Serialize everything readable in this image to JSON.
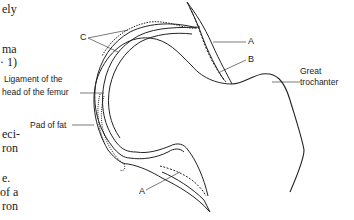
{
  "page_text_fragments": [
    {
      "text": "ely",
      "x": 2,
      "y": 9
    },
    {
      "text": "ma",
      "x": 2,
      "y": 49
    },
    {
      "text": "· 1)",
      "x": 0,
      "y": 62
    },
    {
      "text": "eci-",
      "x": 2,
      "y": 134
    },
    {
      "text": "ron",
      "x": 2,
      "y": 148
    },
    {
      "text": "e.",
      "x": 2,
      "y": 178
    },
    {
      "text": "of a",
      "x": 0,
      "y": 192
    },
    {
      "text": "ron",
      "x": 2,
      "y": 206
    }
  ],
  "diagram": {
    "labels": {
      "ligament": "Ligament of the",
      "ligament_line2": "head of the femur",
      "pad_of_fat": "Pad of fat",
      "great": "Great",
      "trochanter": "trochanter",
      "c": "C",
      "a_top": "A",
      "b": "B",
      "a_bottom": "A"
    },
    "colors": {
      "ink": "#222222",
      "background": "#ffffff"
    }
  }
}
